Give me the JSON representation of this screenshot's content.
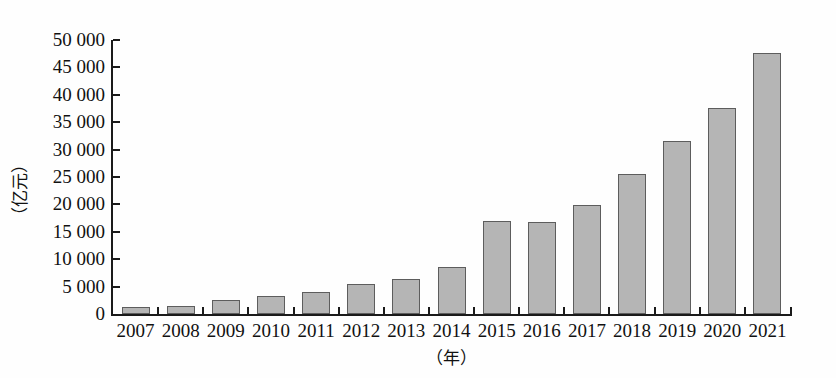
{
  "chart_data": {
    "type": "bar",
    "title": "",
    "subtitle": "",
    "xlabel": "（年）",
    "ylabel": "（亿元）",
    "categories": [
      "2007",
      "2008",
      "2009",
      "2010",
      "2011",
      "2012",
      "2013",
      "2014",
      "2015",
      "2016",
      "2017",
      "2018",
      "2019",
      "2020",
      "2021"
    ],
    "values": [
      1300,
      1500,
      2500,
      3200,
      4100,
      5500,
      6400,
      8600,
      17000,
      16800,
      19900,
      25600,
      31600,
      37600,
      47700
    ],
    "series": [
      {
        "name": "",
        "values": [
          1300,
          1500,
          2500,
          3200,
          4100,
          5500,
          6400,
          8600,
          17000,
          16800,
          19900,
          25600,
          31600,
          37600,
          47700
        ]
      }
    ],
    "ylim": [
      0,
      50000
    ],
    "ytick_values": [
      0,
      5000,
      10000,
      15000,
      20000,
      25000,
      30000,
      35000,
      40000,
      45000,
      50000
    ],
    "ytick_labels": [
      "0",
      "5 000",
      "10 000",
      "15 000",
      "20 000",
      "25 000",
      "30 000",
      "35 000",
      "40 000",
      "45 000",
      "50 000"
    ],
    "grid": false,
    "legend": null,
    "legend_position": "none",
    "bar_fill_color": "#b5b5b5",
    "bar_border_color": "#5d5d5d",
    "axis_color": "#1a1a1a",
    "background_color": "#fefefe"
  },
  "layout": {
    "plot_left": 113,
    "plot_right": 790,
    "plot_top": 40,
    "plot_bottom": 314,
    "bar_width": 28,
    "slot_width": 45.13
  }
}
